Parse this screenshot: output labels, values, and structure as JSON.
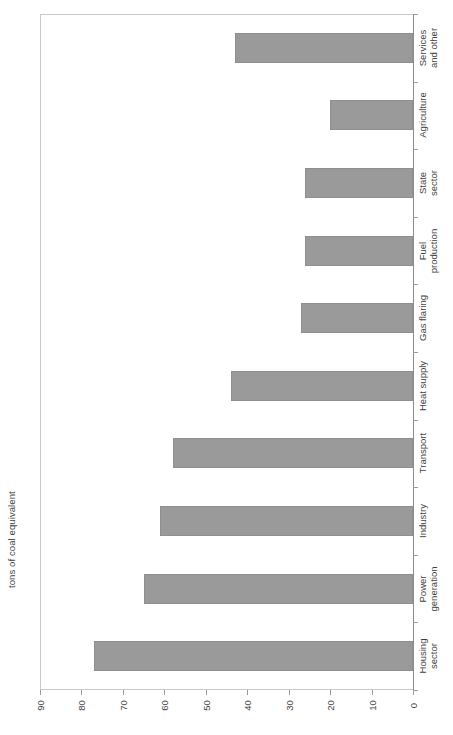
{
  "chart_data": {
    "type": "bar",
    "orientation": "horizontal-rotated",
    "title": "",
    "xlabel": "",
    "ylabel": "tons of coal equivalent",
    "axis_title": "tons of coal equivalent",
    "categories": [
      "Housing sector",
      "Power generation",
      "Industry",
      "Transport",
      "Heat supply",
      "Gas flaring",
      "Fuel production",
      "State sector",
      "Agriculture",
      "Services and other"
    ],
    "category_labels_wrapped": [
      "Housing\nsector",
      "Power\ngeneration",
      "Industry",
      "Transport",
      "Heat supply",
      "Gas flaring",
      "Fuel\nproduction",
      "State\nsector",
      "Agriculture",
      "Services\nand other"
    ],
    "values": [
      77,
      65,
      61,
      58,
      44,
      27,
      26,
      26,
      20,
      43
    ],
    "ylim": [
      0,
      90
    ],
    "axis_ticks": [
      90,
      80,
      70,
      60,
      50,
      40,
      30,
      20,
      10,
      0
    ],
    "tick_labels": [
      "90",
      "80",
      "70",
      "60",
      "50",
      "40",
      "30",
      "20",
      "10",
      "0"
    ],
    "grid": false,
    "legend": null,
    "bar_color": "#9a9a9a",
    "bar_border_color": "#8f8f8f",
    "axis_color": "#c9c9c9",
    "text_color": "#3f3f3f"
  }
}
